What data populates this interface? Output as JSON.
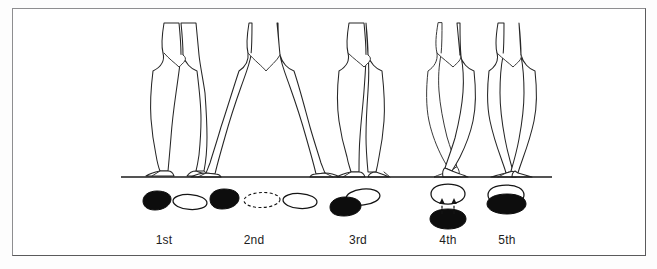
{
  "figure": {
    "background_color": "#ffffff",
    "frame_color": "#8e8e90",
    "ink_color": "#1b1b1b",
    "ground_line": {
      "x1": 120,
      "y1": 175,
      "x2": 551,
      "y2": 175
    }
  },
  "positions": [
    {
      "id": "first",
      "label": "1st",
      "label_x": 163,
      "label_y": 232,
      "legs_center_x": 178,
      "description": "Heels together, toes turned out to the sides, legs straight and parallel",
      "feet": [
        {
          "name": "left-foot-dark",
          "fill": "dark",
          "cx": 155,
          "cy": 200,
          "rx": 15,
          "ry": 8,
          "rotate": -12
        },
        {
          "name": "right-foot-light",
          "fill": "light",
          "cx": 188,
          "cy": 202,
          "rx": 16,
          "ry": 7,
          "rotate": 8
        }
      ]
    },
    {
      "id": "second",
      "label": "2nd",
      "label_x": 253,
      "label_y": 232,
      "legs_center_x": 265,
      "description": "Feet turned out and separated by about one foot length; dashed outline shows the travelling foot",
      "feet": [
        {
          "name": "left-foot-dark",
          "fill": "dark",
          "cx": 224,
          "cy": 198,
          "rx": 16,
          "ry": 8,
          "rotate": -14
        },
        {
          "name": "middle-foot-dashed",
          "fill": "dashed",
          "cx": 261,
          "cy": 200,
          "rx": 17,
          "ry": 7,
          "rotate": 3
        },
        {
          "name": "right-foot-light",
          "fill": "light",
          "cx": 298,
          "cy": 200,
          "rx": 16,
          "ry": 7,
          "rotate": 6
        }
      ]
    },
    {
      "id": "third",
      "label": "3rd",
      "label_x": 357,
      "label_y": 232,
      "legs_center_x": 362,
      "description": "One foot placed in front so the heel touches the middle of the other foot",
      "feet": [
        {
          "name": "back-foot-light",
          "fill": "light",
          "cx": 361,
          "cy": 197,
          "rx": 16,
          "ry": 7,
          "rotate": -6
        },
        {
          "name": "front-foot-dark",
          "fill": "dark",
          "cx": 344,
          "cy": 206,
          "rx": 16,
          "ry": 8,
          "rotate": -10
        }
      ]
    },
    {
      "id": "fourth",
      "label": "4th",
      "label_x": 447,
      "label_y": 232,
      "legs_center_x": 450,
      "description": "Feet turned out one in front of the other, separated by about one foot length; dashed arrows show the offset",
      "feet": [
        {
          "name": "front-foot-light",
          "fill": "light",
          "cx": 447,
          "cy": 193,
          "rx": 16,
          "ry": 8,
          "rotate": 0
        },
        {
          "name": "back-foot-dark",
          "fill": "dark",
          "cx": 447,
          "cy": 218,
          "rx": 17,
          "ry": 8,
          "rotate": 0
        }
      ],
      "arrows": [
        {
          "name": "left-offset-arrow",
          "x1": 441,
          "y1": 214,
          "x2": 441,
          "y2": 200
        },
        {
          "name": "right-offset-arrow",
          "x1": 453,
          "y1": 214,
          "x2": 453,
          "y2": 200
        }
      ]
    },
    {
      "id": "fifth",
      "label": "5th",
      "label_x": 506,
      "label_y": 232,
      "legs_center_x": 511,
      "description": "Feet fully crossed, heel of the front foot against the toe of the back foot",
      "feet": [
        {
          "name": "front-foot-light",
          "fill": "light",
          "cx": 504,
          "cy": 194,
          "rx": 16,
          "ry": 7,
          "rotate": -3
        },
        {
          "name": "back-foot-dark",
          "fill": "dark",
          "cx": 506,
          "cy": 203,
          "rx": 17,
          "ry": 8,
          "rotate": 2
        }
      ]
    }
  ]
}
